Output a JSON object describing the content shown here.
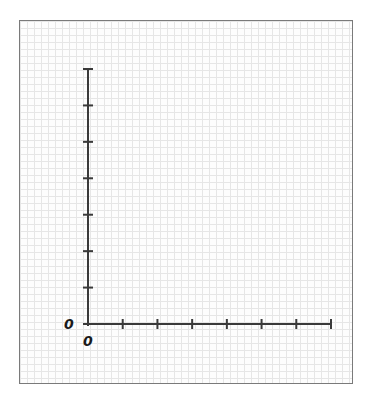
{
  "chart_data": {
    "type": "line",
    "title": "",
    "xlabel": "",
    "ylabel": "",
    "x_origin_label": "0",
    "y_origin_label": "0",
    "x_ticks": 7,
    "y_ticks": 7,
    "series": [],
    "grid": true,
    "legend": null,
    "note": "Blank graph-paper axes with origin labeled 0 on both axes; 7 unlabeled tick marks on each axis; no data plotted."
  },
  "colors": {
    "axis": "#3a3a3a",
    "grid": "#e6e6e6",
    "frame": "#7a7a7a"
  },
  "labels": {
    "y_zero": "0",
    "x_zero": "0"
  }
}
